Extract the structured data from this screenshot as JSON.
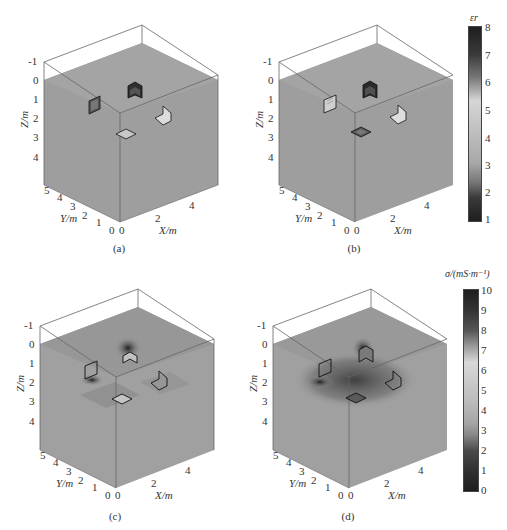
{
  "figure": {
    "panels": [
      {
        "id": "a",
        "caption": "(a)",
        "model": "true-permittivity"
      },
      {
        "id": "b",
        "caption": "(b)",
        "model": "inverted-permittivity"
      },
      {
        "id": "c",
        "caption": "(c)",
        "model": "conductivity-inversion-1"
      },
      {
        "id": "d",
        "caption": "(d)",
        "model": "conductivity-inversion-2"
      }
    ],
    "axes": {
      "z_label": "Z/m",
      "y_label": "Y/m",
      "x_label": "X/m",
      "z_ticks": [
        "-1",
        "0",
        "1",
        "2",
        "3",
        "4"
      ],
      "y_ticks": [
        "0",
        "1",
        "2",
        "3",
        "4",
        "5"
      ],
      "x_ticks": [
        "0",
        "2",
        "4"
      ]
    },
    "colorbar_permittivity": {
      "title": "εr",
      "ticks": [
        "8",
        "7",
        "6",
        "5",
        "4",
        "3",
        "2",
        "1"
      ],
      "min": 1,
      "max": 8
    },
    "colorbar_conductivity": {
      "title": "σ/(mS·m⁻¹)",
      "ticks": [
        "10",
        "9",
        "8",
        "7",
        "6",
        "5",
        "4",
        "3",
        "2",
        "1",
        "0"
      ],
      "min": 0,
      "max": 10
    },
    "colors": {
      "background": "#ffffff",
      "cube_fill": "#9c9c9c",
      "frame": "#555555",
      "anomaly_dark": "#2a2a2a",
      "anomaly_light": "#d8d8d8"
    }
  }
}
